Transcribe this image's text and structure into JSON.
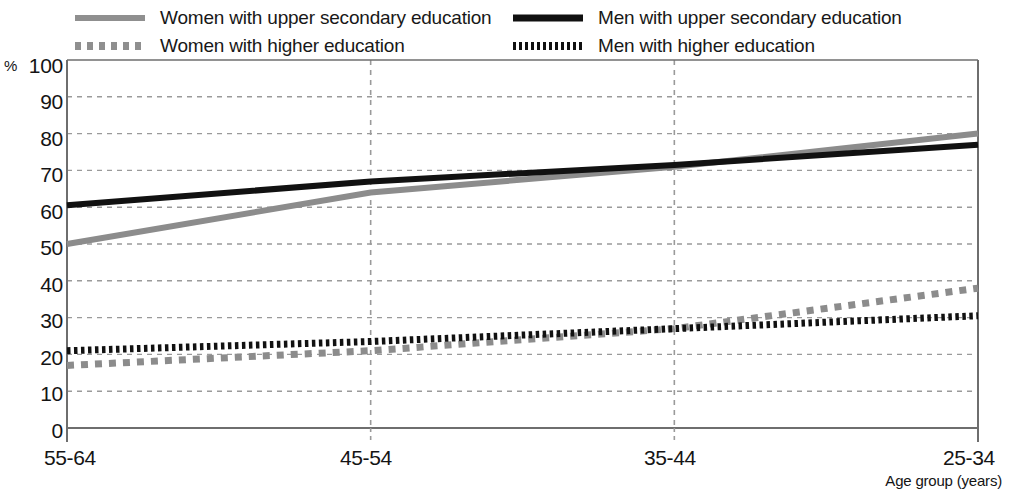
{
  "chart_data": {
    "type": "line",
    "title": "",
    "subtitle": "",
    "xlabel": "Age group (years)",
    "ylabel": "%",
    "categories": [
      "55-64",
      "45-54",
      "35-44",
      "25-34"
    ],
    "x": [
      0,
      1,
      2,
      3
    ],
    "ylim": [
      0,
      100
    ],
    "ytick_step": 10,
    "yticks": [
      "100",
      "90",
      "80",
      "70",
      "60",
      "50",
      "40",
      "30",
      "20",
      "10",
      "0"
    ],
    "grid": "dashed-both",
    "legend_position": "top",
    "series": [
      {
        "name": "Women with upper secondary education",
        "key": "women_upper_secondary",
        "style": "solid",
        "color": "#8c8c8c",
        "width": 6,
        "values": [
          50,
          64,
          71,
          80
        ]
      },
      {
        "name": "Men with upper secondary education",
        "key": "men_upper_secondary",
        "style": "solid",
        "color": "#111111",
        "width": 6,
        "values": [
          60.5,
          67,
          71.5,
          77
        ]
      },
      {
        "name": "Women with higher education",
        "key": "women_higher",
        "style": "dotted",
        "color": "#8c8c8c",
        "width": 7,
        "values": [
          17,
          21,
          27,
          38
        ]
      },
      {
        "name": "Men with higher education",
        "key": "men_higher",
        "style": "dotted",
        "color": "#111111",
        "width": 7,
        "values": [
          21,
          23.5,
          27,
          30.5
        ]
      }
    ]
  },
  "legend": {
    "items": [
      {
        "label": "Women with upper secondary education",
        "swatch": "gray-solid-line",
        "row": 1,
        "col": 1
      },
      {
        "label": "Men with upper secondary education",
        "swatch": "black-solid-line",
        "row": 1,
        "col": 2
      },
      {
        "label": "Women with higher education",
        "swatch": "gray-dotted-line",
        "row": 2,
        "col": 1
      },
      {
        "label": "Men with higher education",
        "swatch": "black-dotted-line",
        "row": 2,
        "col": 2
      }
    ]
  },
  "axes": {
    "y_unit": "%",
    "y_labels": [
      "100",
      "90",
      "80",
      "70",
      "60",
      "50",
      "40",
      "30",
      "20",
      "10",
      "0"
    ],
    "x_labels": [
      "55-64",
      "45-54",
      "35-44",
      "25-34"
    ],
    "x_title": "Age group (years)"
  },
  "colors": {
    "women": "#8c8c8c",
    "men": "#111111",
    "axis": "#6e6e6e",
    "grid": "#9a9a9a",
    "text": "#141414"
  }
}
